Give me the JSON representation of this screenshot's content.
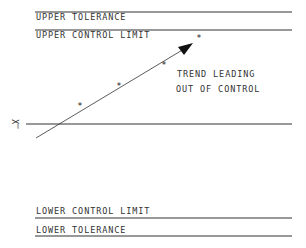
{
  "labels": {
    "upper_tolerance": "UPPER TOLERANCE",
    "upper_control_limit": "UPPER CONTROL LIMIT",
    "lower_control_limit": "LOWER CONTROL LIMIT",
    "lower_tolerance": "LOWER TOLERANCE",
    "centre_line_symbol": "X̿",
    "annotation_line1": "TREND LEADING",
    "annotation_line2": "OUT OF CONTROL"
  },
  "data_points": [
    {
      "x": 80,
      "y": 105
    },
    {
      "x": 119,
      "y": 85
    },
    {
      "x": 164,
      "y": 64
    },
    {
      "x": 199,
      "y": 37
    }
  ],
  "colors": {
    "line": "#333333",
    "text": "#333333"
  }
}
